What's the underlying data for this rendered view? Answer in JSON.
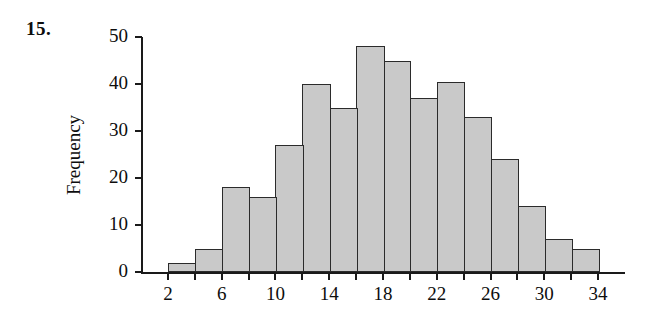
{
  "exercise": {
    "number": "15."
  },
  "chart_data": {
    "type": "bar",
    "title": "",
    "xlabel": "",
    "ylabel": "Frequency",
    "xlim": [
      0,
      36
    ],
    "ylim": [
      0,
      50
    ],
    "grid": false,
    "legend": null,
    "bin_width": 2,
    "bin_edges": [
      2,
      4,
      6,
      8,
      10,
      12,
      14,
      16,
      18,
      20,
      22,
      24,
      26,
      28,
      30,
      32,
      34
    ],
    "categories": [
      "2-4",
      "4-6",
      "6-8",
      "8-10",
      "10-12",
      "12-14",
      "14-16",
      "16-18",
      "18-20",
      "20-22",
      "22-24",
      "24-26",
      "26-28",
      "28-30",
      "30-32",
      "32-34"
    ],
    "values": [
      2,
      5,
      18,
      16,
      27,
      40,
      35,
      48,
      45,
      37,
      40.5,
      33,
      24,
      14,
      7,
      5
    ],
    "x_tick_values": [
      2,
      4,
      6,
      8,
      10,
      12,
      14,
      16,
      18,
      20,
      22,
      24,
      26,
      28,
      30,
      32,
      34
    ],
    "x_tick_labels": [
      "2",
      "",
      "6",
      "",
      "10",
      "",
      "14",
      "",
      "18",
      "",
      "22",
      "",
      "26",
      "",
      "30",
      "",
      "34"
    ],
    "y_tick_values": [
      0,
      10,
      20,
      30,
      40,
      50
    ],
    "y_tick_labels": [
      "0",
      "10",
      "20",
      "30",
      "40",
      "50"
    ],
    "bar_fill_color": "#c9c9c9",
    "bar_edge_color": "#2b2b2b",
    "axis_color": "#1a1a1a"
  }
}
